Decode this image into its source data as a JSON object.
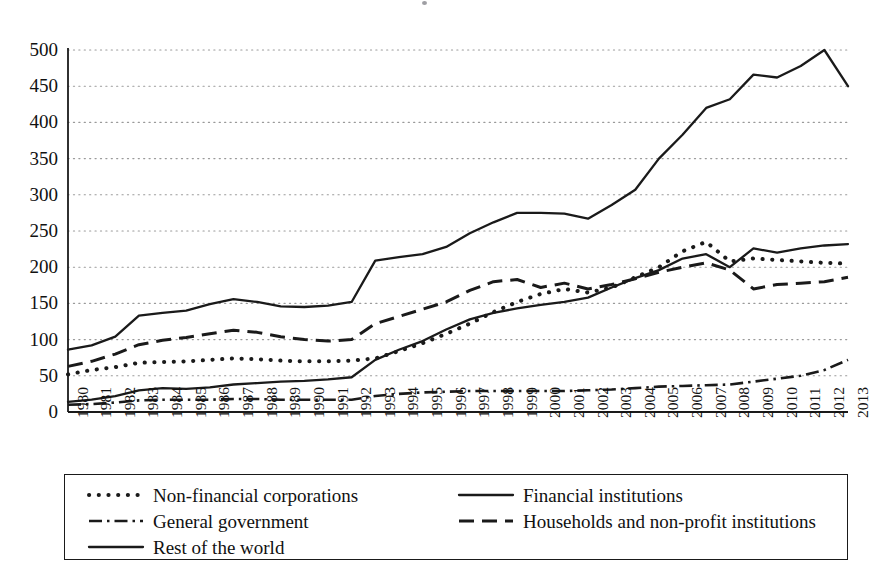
{
  "chart_data": {
    "type": "line",
    "title": "",
    "subtitle": "",
    "xlabel": "",
    "ylabel": "",
    "ylim": [
      0,
      520
    ],
    "yticks": [
      0,
      50,
      100,
      150,
      200,
      250,
      300,
      350,
      400,
      450,
      500
    ],
    "grid": "horizontal-dotted",
    "legend_position": "below-plot",
    "categories": [
      "1980",
      "1981",
      "1982",
      "1983",
      "1984",
      "1985",
      "1986",
      "1987",
      "1988",
      "1989",
      "1990",
      "1991",
      "1992",
      "1993",
      "1994",
      "1995",
      "1996",
      "1997",
      "1998",
      "1999",
      "2000",
      "2001",
      "2002",
      "2003",
      "2004",
      "2005",
      "2006",
      "2007",
      "2008",
      "2009",
      "2010",
      "2011",
      "2012",
      "2013"
    ],
    "series": [
      {
        "name": "Non-financial corporations",
        "style": "dotted",
        "values": [
          52,
          58,
          62,
          68,
          69,
          70,
          72,
          74,
          73,
          71,
          70,
          70,
          71,
          74,
          84,
          95,
          108,
          122,
          138,
          152,
          163,
          170,
          165,
          172,
          186,
          200,
          222,
          235,
          208,
          212,
          210,
          208,
          206,
          205
        ]
      },
      {
        "name": "Financial institutions",
        "style": "solid",
        "values": [
          14,
          17,
          22,
          30,
          33,
          32,
          34,
          38,
          40,
          42,
          43,
          45,
          48,
          72,
          86,
          98,
          114,
          128,
          137,
          143,
          148,
          152,
          158,
          172,
          185,
          196,
          212,
          218,
          200,
          226,
          220,
          226,
          230,
          232
        ]
      },
      {
        "name": "General government",
        "style": "dashdot",
        "values": [
          10,
          11,
          13,
          16,
          17,
          17,
          17,
          18,
          18,
          17,
          17,
          17,
          17,
          22,
          25,
          27,
          28,
          29,
          29,
          29,
          29,
          29,
          30,
          31,
          33,
          35,
          36,
          37,
          38,
          42,
          46,
          50,
          58,
          72
        ]
      },
      {
        "name": "Households and non-profit institutions",
        "style": "dashed",
        "values": [
          63,
          70,
          80,
          93,
          99,
          103,
          108,
          113,
          110,
          104,
          100,
          98,
          100,
          122,
          132,
          142,
          152,
          168,
          180,
          183,
          172,
          178,
          170,
          176,
          184,
          193,
          200,
          206,
          196,
          170,
          176,
          178,
          180,
          186
        ]
      },
      {
        "name": "Rest of the world",
        "style": "solid",
        "values": [
          86,
          92,
          104,
          133,
          137,
          140,
          149,
          156,
          152,
          146,
          145,
          147,
          152,
          209,
          214,
          218,
          228,
          247,
          262,
          275,
          275,
          274,
          267,
          286,
          307,
          350,
          383,
          420,
          432,
          466,
          462,
          478,
          500,
          450
        ]
      }
    ]
  },
  "axes": {
    "ytick_labels": [
      "500",
      "450",
      "400",
      "350",
      "300",
      "250",
      "200",
      "150",
      "100",
      "50",
      "0"
    ],
    "xtick_labels": [
      "1980",
      "1981",
      "1982",
      "1983",
      "1984",
      "1985",
      "1986",
      "1987",
      "1988",
      "1989",
      "1990",
      "1991",
      "1992",
      "1993",
      "1994",
      "1995",
      "1996",
      "1997",
      "1998",
      "1999",
      "2000",
      "2001",
      "2002",
      "2003",
      "2004",
      "2005",
      "2006",
      "2007",
      "2008",
      "2009",
      "2010",
      "2011",
      "2012",
      "2013"
    ]
  },
  "legend": {
    "entries": [
      {
        "label": "Non-financial corporations",
        "style": "dotted"
      },
      {
        "label": "Financial institutions",
        "style": "solid"
      },
      {
        "label": "General government",
        "style": "dashdot"
      },
      {
        "label": "Households and non-profit institutions",
        "style": "dashed"
      },
      {
        "label": "Rest of the world",
        "style": "solid"
      }
    ]
  },
  "colors": {
    "line": "#1a1a1a",
    "grid": "#9a9a9a",
    "axis": "#1a1a1a",
    "background": "#ffffff"
  }
}
